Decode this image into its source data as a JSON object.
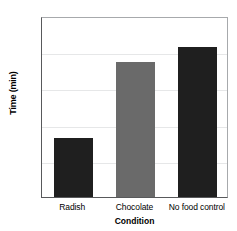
{
  "chart_data": {
    "type": "bar",
    "title": "",
    "xlabel": "Condition",
    "ylabel": "Time (min)",
    "categories": [
      "Radish",
      "Chocolate",
      "No food control"
    ],
    "values": [
      8.1,
      18.7,
      20.7
    ],
    "ylim": [
      0,
      25
    ],
    "yticks": [
      "0",
      "5",
      "10",
      "15",
      "20",
      "25"
    ],
    "ytick_values": [
      0,
      5,
      10,
      15,
      20,
      25
    ],
    "grid": "horizontal",
    "legend": "none",
    "bar_colors": [
      "#1f1f1f",
      "#6a6a6a",
      "#1f1f1f"
    ]
  },
  "colors": {
    "axis": "#58595b",
    "frame_light": "#a7a9ac",
    "gridline": "#e6e7e8",
    "background": "#ffffff",
    "text": "#000000"
  }
}
